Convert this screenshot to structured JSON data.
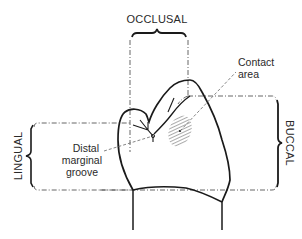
{
  "diagram": {
    "type": "tooth-surface-anatomy",
    "labels": {
      "occlusal": "OCCLUSAL",
      "buccal": "BUCCAL",
      "lingual": "LINGUAL",
      "contact_area_line1": "Contact",
      "contact_area_line2": "area",
      "distal_line1": "Distal",
      "distal_line2": "marginal",
      "distal_line3": "groove"
    },
    "colors": {
      "ink": "#1a1a1a",
      "text": "#2a2a2a",
      "guide": "#555555",
      "background": "#ffffff"
    }
  }
}
